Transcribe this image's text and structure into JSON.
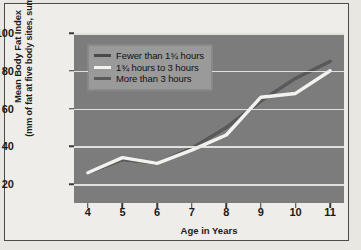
{
  "chart_data": {
    "type": "line",
    "title": "",
    "xlabel": "Age in Years",
    "ylabel": "Mean Body Fat Index (mm of fat at five body sites, summed)",
    "ylabel_line1": "Mean Body Fat Index",
    "ylabel_line2": "(mm of fat at five body sites, summed)",
    "x": [
      4,
      5,
      6,
      7,
      8,
      9,
      10,
      11
    ],
    "xticklabels": [
      "4",
      "5",
      "6",
      "7",
      "8",
      "9",
      "10",
      "11"
    ],
    "yticks": [
      20,
      40,
      60,
      80,
      100
    ],
    "yticklabels": [
      "20",
      "40",
      "60",
      "80",
      "100"
    ],
    "ylim": [
      10,
      100
    ],
    "xlim": [
      3.6,
      11.4
    ],
    "grid": "horizontal",
    "legend_position": "upper-left",
    "plot_background": "#7c7c7c",
    "gridline_color": "#e8e8e4",
    "series": [
      {
        "name": "Fewer than 1¾ hours",
        "color": "#4a4a4a",
        "values": [
          26,
          33,
          31,
          39,
          50,
          64,
          76,
          85
        ]
      },
      {
        "name": "1¾ hours to 3 hours",
        "color": "#f2f2ee",
        "values": [
          26,
          34,
          31,
          38,
          46,
          66,
          68,
          80
        ]
      },
      {
        "name": "More than 3 hours",
        "color": "#5a5a5a",
        "values": [
          26,
          33,
          31,
          39,
          50,
          64,
          76,
          85
        ]
      }
    ]
  }
}
